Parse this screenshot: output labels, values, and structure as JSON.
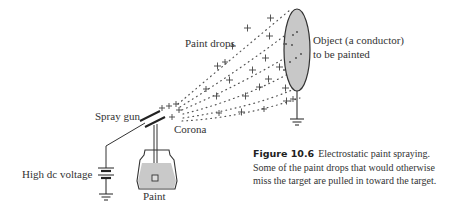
{
  "figure": {
    "labels": {
      "paint_drops": "Paint drops",
      "object_line1": "Object (a conductor)",
      "object_line2": "to be painted",
      "spray_gun": "Spray gun",
      "corona": "Corona",
      "high_dc_voltage": "High dc voltage",
      "paint": "Paint"
    },
    "caption": {
      "number": "Figure 10.6",
      "text": "Electrostatic paint spraying. Some of the paint drops that would otherwise miss the target are pulled in toward the target."
    },
    "charge_symbol": "+",
    "colors": {
      "ink": "#333333",
      "object_fill": "#c8c8c8",
      "paint_fill": "#c9c9c9"
    }
  }
}
